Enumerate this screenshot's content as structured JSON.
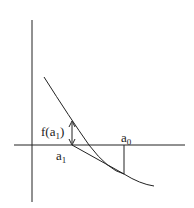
{
  "diagram": {
    "labels": {
      "f_a1_prefix": "f(a",
      "f_a1_sub": "1",
      "f_a1_suffix": ")",
      "a0_base": "a",
      "a0_sub": "0",
      "a1_base": "a",
      "a1_sub": "1"
    },
    "colors": {
      "stroke": "#222222",
      "background": "#ffffff"
    }
  }
}
